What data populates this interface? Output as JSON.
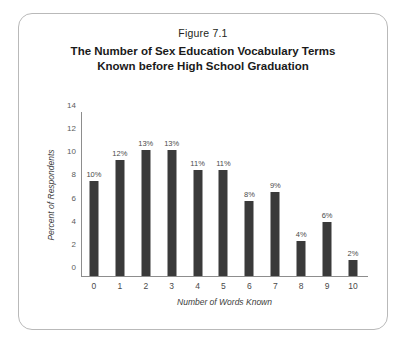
{
  "figure": {
    "number_label": "Figure 7.1",
    "title_lines": [
      "The Number of Sex Education Vocabulary Terms",
      "Known before High School Graduation"
    ],
    "border_color": "#b9b9b9",
    "background_color": "#ffffff"
  },
  "chart_data": {
    "type": "bar",
    "title": "The Number of Sex Education Vocabulary Terms Known before High School Graduation",
    "subtitle": "Figure 7.1",
    "xlabel": "Number of Words Known",
    "ylabel": "Percent of Respondents",
    "categories": [
      "0",
      "1",
      "2",
      "3",
      "4",
      "5",
      "6",
      "7",
      "8",
      "9",
      "10"
    ],
    "values": [
      8.2,
      10.0,
      10.9,
      10.9,
      9.2,
      9.2,
      6.5,
      7.3,
      3.0,
      4.7,
      1.4
    ],
    "data_labels": [
      "10%",
      "12%",
      "13%",
      "13%",
      "11%",
      "11%",
      "8%",
      "9%",
      "4%",
      "6%",
      "2%"
    ],
    "ylim": [
      0,
      14
    ],
    "yticks": [
      0,
      2,
      4,
      6,
      8,
      10,
      12,
      14
    ],
    "ytick_labels": [
      "0",
      "2",
      "4",
      "6",
      "8",
      "10",
      "12",
      "14"
    ],
    "grid": false,
    "legend": false,
    "bar_color": "#3a3a3a",
    "axis_color": "#8d8d8d"
  }
}
